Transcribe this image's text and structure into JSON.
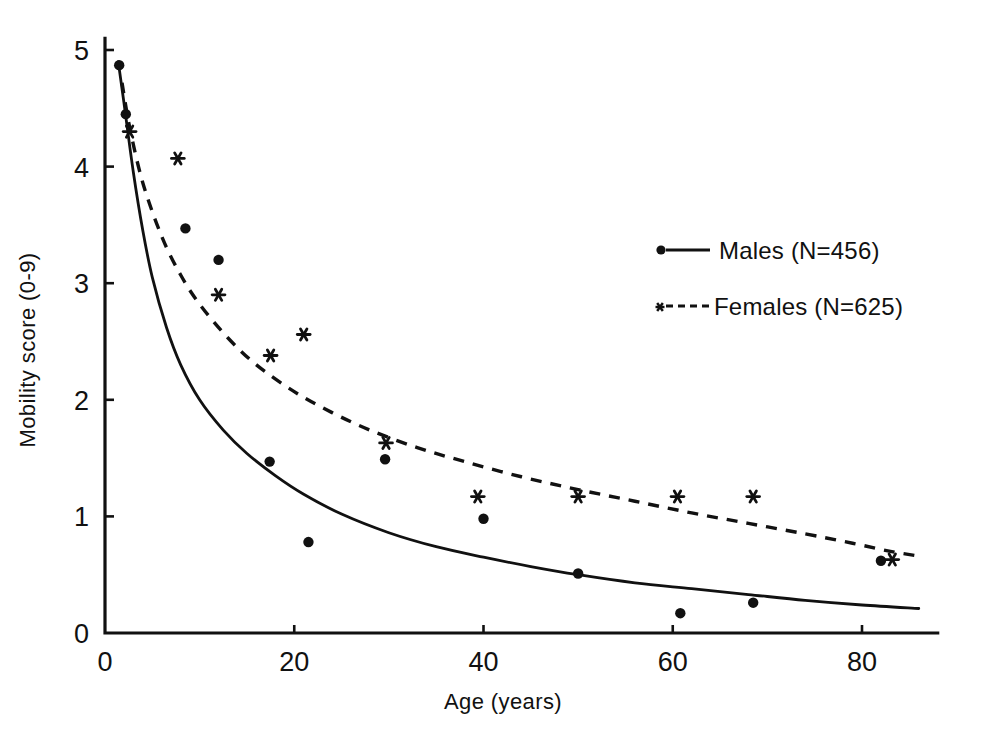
{
  "chart_data": {
    "type": "scatter",
    "title": "",
    "xlabel": "Age (years)",
    "ylabel": "Mobility score (0-9)",
    "xlim": [
      0,
      88
    ],
    "ylim": [
      0,
      5.1
    ],
    "xticks": [
      0,
      20,
      40,
      60,
      80
    ],
    "xtick_labels": [
      "0",
      "20",
      "40",
      "60",
      "80"
    ],
    "yticks": [
      0,
      1,
      2,
      3,
      4,
      5
    ],
    "ytick_labels": [
      "0",
      "1",
      "2",
      "3",
      "4",
      "5"
    ],
    "grid": false,
    "legend_position": "right-upper",
    "series": [
      {
        "name": "Males (N=456)",
        "marker": "dot",
        "line_style": "solid",
        "n": 456,
        "points": [
          {
            "x": 1.5,
            "y": 4.87
          },
          {
            "x": 2.2,
            "y": 4.45
          },
          {
            "x": 8.5,
            "y": 3.47
          },
          {
            "x": 12.0,
            "y": 3.2
          },
          {
            "x": 17.4,
            "y": 1.47
          },
          {
            "x": 21.5,
            "y": 0.78
          },
          {
            "x": 29.6,
            "y": 1.49
          },
          {
            "x": 40.0,
            "y": 0.98
          },
          {
            "x": 50.0,
            "y": 0.51
          },
          {
            "x": 60.8,
            "y": 0.17
          },
          {
            "x": 68.5,
            "y": 0.26
          },
          {
            "x": 82.0,
            "y": 0.62
          }
        ],
        "fit_curve": [
          {
            "x": 1.4,
            "y": 4.9
          },
          {
            "x": 2.0,
            "y": 4.55
          },
          {
            "x": 3.0,
            "y": 3.95
          },
          {
            "x": 4.0,
            "y": 3.45
          },
          {
            "x": 5.0,
            "y": 3.05
          },
          {
            "x": 6.5,
            "y": 2.62
          },
          {
            "x": 8.0,
            "y": 2.3
          },
          {
            "x": 10.0,
            "y": 2.0
          },
          {
            "x": 12.5,
            "y": 1.74
          },
          {
            "x": 15.0,
            "y": 1.54
          },
          {
            "x": 18.0,
            "y": 1.35
          },
          {
            "x": 21.0,
            "y": 1.19
          },
          {
            "x": 25.0,
            "y": 1.02
          },
          {
            "x": 30.0,
            "y": 0.86
          },
          {
            "x": 35.0,
            "y": 0.74
          },
          {
            "x": 40.0,
            "y": 0.65
          },
          {
            "x": 45.0,
            "y": 0.57
          },
          {
            "x": 50.0,
            "y": 0.5
          },
          {
            "x": 56.0,
            "y": 0.43
          },
          {
            "x": 62.0,
            "y": 0.38
          },
          {
            "x": 68.0,
            "y": 0.33
          },
          {
            "x": 74.0,
            "y": 0.28
          },
          {
            "x": 80.0,
            "y": 0.24
          },
          {
            "x": 86.0,
            "y": 0.21
          }
        ]
      },
      {
        "name": "Females (N=625)",
        "marker": "star",
        "line_style": "dashed",
        "n": 625,
        "points": [
          {
            "x": 2.6,
            "y": 4.3
          },
          {
            "x": 7.7,
            "y": 4.07
          },
          {
            "x": 12.0,
            "y": 2.9
          },
          {
            "x": 17.5,
            "y": 2.38
          },
          {
            "x": 21.0,
            "y": 2.56
          },
          {
            "x": 29.7,
            "y": 1.63
          },
          {
            "x": 39.4,
            "y": 1.17
          },
          {
            "x": 50.0,
            "y": 1.17
          },
          {
            "x": 60.5,
            "y": 1.17
          },
          {
            "x": 68.5,
            "y": 1.17
          },
          {
            "x": 83.2,
            "y": 0.63
          }
        ],
        "fit_curve": [
          {
            "x": 1.8,
            "y": 4.72
          },
          {
            "x": 2.6,
            "y": 4.34
          },
          {
            "x": 4.0,
            "y": 3.86
          },
          {
            "x": 6.0,
            "y": 3.4
          },
          {
            "x": 8.0,
            "y": 3.07
          },
          {
            "x": 10.0,
            "y": 2.82
          },
          {
            "x": 13.0,
            "y": 2.53
          },
          {
            "x": 16.0,
            "y": 2.3
          },
          {
            "x": 20.0,
            "y": 2.07
          },
          {
            "x": 24.0,
            "y": 1.89
          },
          {
            "x": 28.0,
            "y": 1.74
          },
          {
            "x": 33.0,
            "y": 1.59
          },
          {
            "x": 38.0,
            "y": 1.47
          },
          {
            "x": 44.0,
            "y": 1.34
          },
          {
            "x": 50.0,
            "y": 1.23
          },
          {
            "x": 56.0,
            "y": 1.13
          },
          {
            "x": 62.0,
            "y": 1.03
          },
          {
            "x": 68.0,
            "y": 0.94
          },
          {
            "x": 74.0,
            "y": 0.85
          },
          {
            "x": 79.0,
            "y": 0.77
          },
          {
            "x": 83.0,
            "y": 0.7
          },
          {
            "x": 86.0,
            "y": 0.66
          }
        ]
      }
    ]
  },
  "axes": {
    "xlabel": "Age (years)",
    "ylabel": "Mobility score (0-9)"
  },
  "legend": {
    "entries": [
      {
        "label": "Males (N=456)",
        "marker": "dot",
        "line": "solid"
      },
      {
        "label": "Females (N=625)",
        "marker": "star",
        "line": "dashed"
      }
    ]
  },
  "colors": {
    "ink": "#111111",
    "background": "#ffffff"
  }
}
